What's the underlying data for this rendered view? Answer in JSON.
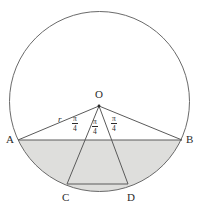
{
  "figure": {
    "type": "circle-geometry-diagram",
    "colors": {
      "background": "#ffffff",
      "stroke": "#5a5a5a",
      "label": "#2b2b2b",
      "shading": "#dededc"
    },
    "circle": {
      "center_x": 99.5,
      "center_y": 101.5,
      "radius": 90
    },
    "points": {
      "O": {
        "x": 99,
        "y": 106,
        "label": "O",
        "label_x": 95,
        "label_y": 89
      },
      "A": {
        "x": 18,
        "y": 140,
        "label": "A",
        "label_x": 6,
        "label_y": 140
      },
      "B": {
        "x": 182,
        "y": 140,
        "label": "B",
        "label_x": 186,
        "label_y": 140
      },
      "C": {
        "x": 67,
        "y": 184,
        "label": "C",
        "label_x": 62,
        "label_y": 198
      },
      "D": {
        "x": 128,
        "y": 184,
        "label": "D",
        "label_x": 127,
        "label_y": 198
      }
    },
    "segments": [
      {
        "name": "OA",
        "from": "O",
        "to": "A"
      },
      {
        "name": "OB",
        "from": "O",
        "to": "B"
      },
      {
        "name": "OC",
        "from": "O",
        "to": "C"
      },
      {
        "name": "OD",
        "from": "O",
        "to": "D"
      },
      {
        "name": "AB",
        "from": "A",
        "to": "B"
      },
      {
        "name": "CD",
        "from": "C",
        "to": "D"
      }
    ],
    "labels": {
      "radius": {
        "text": "r",
        "x": 58,
        "y": 115
      },
      "angles": [
        {
          "name": "angle-AOC",
          "numerator": "π",
          "denominator": "4",
          "x": 72,
          "y": 115
        },
        {
          "name": "angle-COD",
          "numerator": "π",
          "denominator": "4",
          "x": 92,
          "y": 118
        },
        {
          "name": "angle-DOB",
          "numerator": "π",
          "denominator": "4",
          "x": 111,
          "y": 115
        }
      ]
    },
    "shaded_region": {
      "name": "circular-segment-below-AB",
      "fill": "#dededc"
    }
  }
}
